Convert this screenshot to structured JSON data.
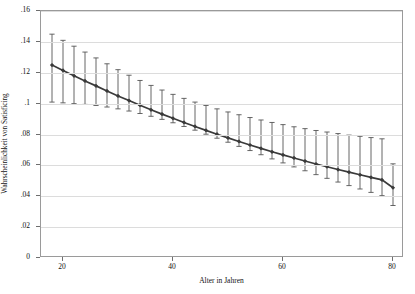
{
  "chart_data": {
    "type": "line",
    "title": "",
    "xlabel": "Alter in Jahren",
    "ylabel": "Wahrscheinlichkeit von Satisficing",
    "xlim": [
      16,
      82
    ],
    "ylim": [
      0,
      0.16
    ],
    "grid": true,
    "legend": null,
    "xticks": [
      20,
      40,
      60,
      80
    ],
    "xtick_labels": [
      "20",
      "40",
      "60",
      "80"
    ],
    "yticks": [
      0,
      0.02,
      0.04,
      0.06,
      0.08,
      0.1,
      0.12,
      0.14,
      0.16
    ],
    "ytick_labels": [
      "0",
      ".02",
      ".04",
      ".06",
      ".08",
      ".1",
      ".12",
      ".14",
      ".16"
    ],
    "marker": "filled-diamond",
    "errorbar": "capped-confidence-interval",
    "series": [
      {
        "name": "Wahrscheinlichkeit von Satisficing",
        "color": "#3a3a3a",
        "x": [
          18,
          20,
          22,
          24,
          26,
          28,
          30,
          32,
          34,
          36,
          38,
          40,
          42,
          44,
          46,
          48,
          50,
          52,
          54,
          56,
          58,
          60,
          62,
          64,
          66,
          68,
          70,
          72,
          74,
          76,
          78,
          80
        ],
        "values": [
          0.125,
          0.1215,
          0.118,
          0.1147,
          0.1115,
          0.1082,
          0.105,
          0.102,
          0.099,
          0.096,
          0.0932,
          0.0905,
          0.0878,
          0.0852,
          0.0827,
          0.0802,
          0.0778,
          0.0755,
          0.0732,
          0.071,
          0.0688,
          0.0668,
          0.0648,
          0.0628,
          0.0609,
          0.0591,
          0.0573,
          0.0556,
          0.0539,
          0.0522,
          0.0506,
          0.0455
        ],
        "ci_lower": [
          0.101,
          0.1005,
          0.1,
          0.0995,
          0.0988,
          0.0978,
          0.0966,
          0.0952,
          0.0936,
          0.0918,
          0.0898,
          0.0876,
          0.0852,
          0.0828,
          0.0802,
          0.0776,
          0.075,
          0.0723,
          0.0696,
          0.0669,
          0.0642,
          0.0616,
          0.059,
          0.0565,
          0.054,
          0.0516,
          0.0492,
          0.0469,
          0.0447,
          0.0425,
          0.0404,
          0.034
        ],
        "ci_upper": [
          0.145,
          0.141,
          0.1372,
          0.1334,
          0.1296,
          0.1258,
          0.122,
          0.1184,
          0.115,
          0.1118,
          0.1088,
          0.106,
          0.1034,
          0.101,
          0.0988,
          0.0966,
          0.0946,
          0.0928,
          0.091,
          0.0894,
          0.0878,
          0.0864,
          0.085,
          0.0838,
          0.0826,
          0.0816,
          0.0806,
          0.0796,
          0.0788,
          0.078,
          0.0772,
          0.061
        ]
      }
    ]
  }
}
